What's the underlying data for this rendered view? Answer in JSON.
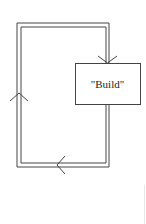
{
  "diagram": {
    "type": "loop-flow",
    "nodes": [
      {
        "id": "build",
        "label": "\"Build\""
      }
    ],
    "edges": [
      {
        "from": "build",
        "to": "build",
        "route": "down-left-up-right-down",
        "style": "double-line"
      }
    ],
    "arrows": [
      {
        "position": "top-of-build-box",
        "direction": "down"
      },
      {
        "position": "bottom-edge",
        "direction": "left"
      },
      {
        "position": "left-edge",
        "direction": "up"
      }
    ],
    "colors": {
      "line": "#444444",
      "background": "#ffffff"
    }
  }
}
